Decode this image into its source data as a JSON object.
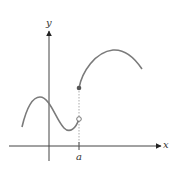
{
  "diagram": {
    "type": "function-graph-jump-discontinuity",
    "axes": {
      "x_label": "x",
      "y_label": "y"
    },
    "tick_labels": {
      "a": "a"
    },
    "points": {
      "filled": {
        "desc": "closed dot at x=a (upper, function value)"
      },
      "open": {
        "desc": "open dot at x=a (lower, left-hand limit)"
      }
    },
    "colors": {
      "curve": "#7a7a7a",
      "axis": "#333333",
      "dot_filled": "#555555",
      "dot_open": "#ffffff"
    }
  }
}
